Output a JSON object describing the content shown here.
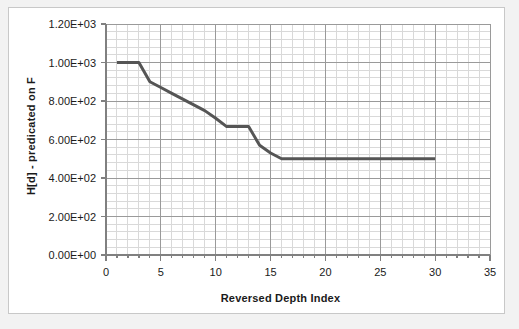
{
  "chart_data": {
    "type": "line",
    "title": "",
    "xlabel": "Reversed Depth Index",
    "ylabel": "H[d] - predicated on F",
    "xlim": [
      0,
      35
    ],
    "ylim": [
      0,
      1200
    ],
    "x_major_step": 5,
    "x_minor_step": 1,
    "y_major_step": 200,
    "y_minor_step": 40,
    "grid": "major-and-minor",
    "legend": "none",
    "x_tick_labels": [
      "0",
      "5",
      "10",
      "15",
      "20",
      "25",
      "30",
      "35"
    ],
    "y_tick_labels": [
      "0.00E+00",
      "2.00E+02",
      "4.00E+02",
      "6.00E+02",
      "8.00E+02",
      "1.00E+03",
      "1.20E+03"
    ],
    "x_tick_values": [
      0,
      5,
      10,
      15,
      20,
      25,
      30,
      35
    ],
    "y_tick_values": [
      0,
      200,
      400,
      600,
      800,
      1000,
      1200
    ],
    "series": [
      {
        "name": "H[d] - predicated on F",
        "color": "#555555",
        "line_width": 3,
        "markers": "none",
        "x": [
          1,
          2,
          3,
          4,
          5,
          6,
          7,
          8,
          9,
          10,
          11,
          12,
          13,
          14,
          15,
          16,
          17,
          18,
          19,
          20,
          21,
          22,
          23,
          24,
          25,
          26,
          27,
          28,
          29,
          30
        ],
        "values": [
          1000,
          1000,
          1000,
          900,
          870,
          840,
          810,
          780,
          750,
          710,
          667,
          667,
          667,
          570,
          530,
          500,
          500,
          500,
          500,
          500,
          500,
          500,
          500,
          500,
          500,
          500,
          500,
          500,
          500,
          500
        ]
      }
    ]
  },
  "figure": {
    "background_color": "#f2f2f2",
    "plot_background_color": "#ffffff",
    "border_color": "#c8c8c8",
    "major_grid_color": "#9a9a9a",
    "minor_grid_color": "#d9d9d9",
    "axis_color": "#808080",
    "text_color": "#1a1a1a"
  }
}
